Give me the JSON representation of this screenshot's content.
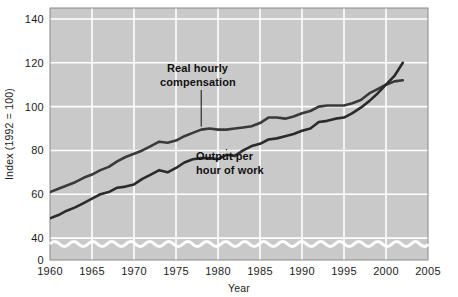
{
  "chart_data": {
    "type": "line",
    "title": "",
    "xlabel": "Year",
    "ylabel": "Index (1992 = 100)",
    "xlim": [
      1960,
      2005
    ],
    "ylim": [
      30,
      145
    ],
    "y_axis_break": true,
    "grid": true,
    "legend_position": "inline-annotations",
    "xticks": [
      1960,
      1965,
      1970,
      1975,
      1980,
      1985,
      1990,
      1995,
      2000,
      2005
    ],
    "xtick_labels": [
      "1960",
      "1965",
      "1970",
      "1975",
      "1980",
      "1985",
      "1990",
      "1995",
      "2000",
      "2005"
    ],
    "yticks": [
      0,
      40,
      60,
      80,
      100,
      120,
      140
    ],
    "ytick_labels": [
      "0",
      "40",
      "60",
      "80",
      "100",
      "120",
      "140"
    ],
    "y_gridlines": [
      40,
      60,
      80,
      100,
      120,
      140
    ],
    "series": [
      {
        "name": "Real hourly compensation",
        "color": "#3a3a3a",
        "annotation": {
          "line1": "Real hourly",
          "line2": "compensation",
          "point_year": 1978,
          "point_value": 90
        },
        "x": [
          1960,
          1961,
          1962,
          1963,
          1964,
          1965,
          1966,
          1967,
          1968,
          1969,
          1970,
          1971,
          1972,
          1973,
          1974,
          1975,
          1976,
          1977,
          1978,
          1979,
          1980,
          1981,
          1982,
          1983,
          1984,
          1985,
          1986,
          1987,
          1988,
          1989,
          1990,
          1991,
          1992,
          1993,
          1994,
          1995,
          1996,
          1997,
          1998,
          1999,
          2000,
          2001,
          2002
        ],
        "values": [
          61,
          62.5,
          64,
          65.5,
          67.5,
          69,
          71,
          72.5,
          75,
          77,
          78.5,
          80,
          82,
          84,
          83.5,
          84.5,
          86.5,
          88,
          89.5,
          90,
          89.5,
          89.5,
          90,
          90.5,
          91,
          92.5,
          95,
          95,
          94.5,
          95.5,
          97,
          98,
          100,
          100.5,
          100.5,
          100.5,
          101.5,
          103,
          106,
          108,
          110,
          111.5,
          112
        ]
      },
      {
        "name": "Output per hour of work",
        "color": "#2b2b2b",
        "annotation": {
          "line1": "Output per",
          "line2": "hour of work",
          "point_year": 1981,
          "point_value": 81
        },
        "x": [
          1960,
          1961,
          1962,
          1963,
          1964,
          1965,
          1966,
          1967,
          1968,
          1969,
          1970,
          1971,
          1972,
          1973,
          1974,
          1975,
          1976,
          1977,
          1978,
          1979,
          1980,
          1981,
          1982,
          1983,
          1984,
          1985,
          1986,
          1987,
          1988,
          1989,
          1990,
          1991,
          1992,
          1993,
          1994,
          1995,
          1996,
          1997,
          1998,
          1999,
          2000,
          2001,
          2002
        ],
        "values": [
          49,
          50.5,
          52.5,
          54,
          56,
          58,
          60,
          61,
          63,
          63.5,
          64.5,
          67,
          69,
          71,
          70,
          72,
          74.5,
          76,
          76.5,
          76.5,
          76,
          78,
          77.5,
          80,
          82,
          83,
          85,
          85.5,
          86.5,
          87.5,
          89,
          90,
          93,
          93.5,
          94.5,
          95,
          97,
          99.5,
          102.5,
          106,
          110,
          114,
          120
        ]
      }
    ]
  },
  "axis": {
    "y_label": "Index (1992 = 100)",
    "x_label": "Year"
  },
  "annotations": {
    "real_hourly": {
      "line1": "Real hourly",
      "line2": "compensation"
    },
    "output_per_hour": {
      "line1": "Output per",
      "line2": "hour of work"
    }
  },
  "style": {
    "plot_background": "#c9c9c9",
    "gridline_color": "#ffffff",
    "line_color": "#333333",
    "text_color": "#111111",
    "break_wave_color": "#ffffff"
  }
}
